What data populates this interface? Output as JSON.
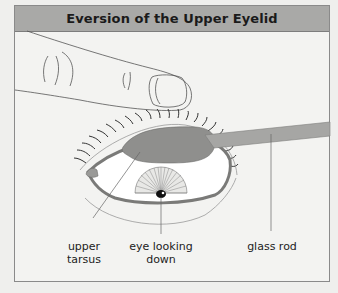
{
  "title": "Eversion of the Upper Eyelid",
  "labels": {
    "upper_tarsus_line1": "upper",
    "upper_tarsus_line2": "tarsus",
    "eye_looking_line1": "eye looking",
    "eye_looking_line2": "down",
    "glass_rod": "glass rod"
  },
  "colors": {
    "title_bar": "#a9a9a7",
    "tarsus": "#8f8f8d",
    "glass_rod": "#a6a6a4",
    "background": "#f3f3f1"
  },
  "icons": [
    "finger-illustration",
    "eye-illustration",
    "glass-rod-illustration"
  ]
}
